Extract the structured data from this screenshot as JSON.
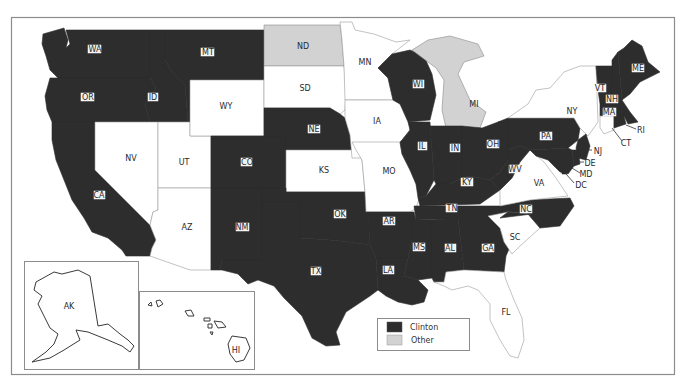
{
  "map": {
    "title": "",
    "colors": {
      "clinton": "#2d2d2d",
      "other": "#d2d2d2",
      "none": "#ffffff"
    },
    "legend": [
      {
        "key": "clinton",
        "label": "Clinton",
        "color": "#2d2d2d"
      },
      {
        "key": "other",
        "label": "Other",
        "color": "#d2d2d2"
      }
    ],
    "states": {
      "WA": {
        "label": "WA",
        "status": "clinton"
      },
      "OR": {
        "label": "OR",
        "status": "clinton"
      },
      "CA": {
        "label": "CA",
        "status": "clinton"
      },
      "ID": {
        "label": "ID",
        "status": "clinton"
      },
      "MT": {
        "label": "MT",
        "status": "clinton"
      },
      "NV": {
        "label": "NV",
        "status": "none"
      },
      "UT": {
        "label": "UT",
        "status": "none"
      },
      "AZ": {
        "label": "AZ",
        "status": "none"
      },
      "WY": {
        "label": "WY",
        "status": "none"
      },
      "CO": {
        "label": "CO",
        "status": "clinton"
      },
      "NM": {
        "label": "NM",
        "status": "clinton"
      },
      "ND": {
        "label": "ND",
        "status": "other"
      },
      "SD": {
        "label": "SD",
        "status": "none"
      },
      "NE": {
        "label": "NE",
        "status": "clinton"
      },
      "KS": {
        "label": "KS",
        "status": "none"
      },
      "OK": {
        "label": "OK",
        "status": "clinton"
      },
      "TX": {
        "label": "TX",
        "status": "clinton"
      },
      "MN": {
        "label": "MN",
        "status": "none"
      },
      "IA": {
        "label": "IA",
        "status": "none"
      },
      "MO": {
        "label": "MO",
        "status": "none"
      },
      "AR": {
        "label": "AR",
        "status": "clinton"
      },
      "LA": {
        "label": "LA",
        "status": "clinton"
      },
      "WI": {
        "label": "WI",
        "status": "clinton"
      },
      "IL": {
        "label": "IL",
        "status": "clinton"
      },
      "MI": {
        "label": "MI",
        "status": "other"
      },
      "IN": {
        "label": "IN",
        "status": "clinton"
      },
      "OH": {
        "label": "OH",
        "status": "clinton"
      },
      "KY": {
        "label": "KY",
        "status": "clinton"
      },
      "TN": {
        "label": "TN",
        "status": "clinton"
      },
      "MS": {
        "label": "MS",
        "status": "clinton"
      },
      "AL": {
        "label": "AL",
        "status": "clinton"
      },
      "GA": {
        "label": "GA",
        "status": "clinton"
      },
      "FL": {
        "label": "FL",
        "status": "none"
      },
      "SC": {
        "label": "SC",
        "status": "none"
      },
      "NC": {
        "label": "NC",
        "status": "clinton"
      },
      "VA": {
        "label": "VA",
        "status": "none"
      },
      "WV": {
        "label": "WV",
        "status": "clinton"
      },
      "PA": {
        "label": "PA",
        "status": "clinton"
      },
      "NY": {
        "label": "NY",
        "status": "none"
      },
      "NJ": {
        "label": "NJ",
        "status": "clinton"
      },
      "DE": {
        "label": "DE",
        "status": "clinton"
      },
      "MD": {
        "label": "MD",
        "status": "clinton"
      },
      "DC": {
        "label": "DC",
        "status": "clinton"
      },
      "VT": {
        "label": "VT",
        "status": "clinton"
      },
      "NH": {
        "label": "NH",
        "status": "clinton"
      },
      "ME": {
        "label": "ME",
        "status": "clinton"
      },
      "MA": {
        "label": "MA",
        "status": "clinton"
      },
      "CT": {
        "label": "CT",
        "status": "none"
      },
      "RI": {
        "label": "RI",
        "status": "clinton"
      },
      "AK": {
        "label": "AK",
        "status": "none"
      },
      "HI": {
        "label": "HI",
        "status": "none"
      }
    }
  }
}
